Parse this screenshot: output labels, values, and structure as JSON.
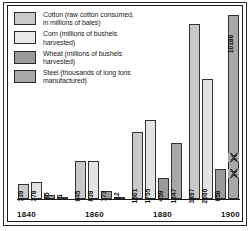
{
  "legend": {
    "items": [
      {
        "name": "cotton",
        "label": "Cotton (raw cotton consumed,\nin millions of bales)",
        "color": "#c9c9c9"
      },
      {
        "name": "corn",
        "label": "Corn (millions of bushels\nharvested)",
        "color": "#e3e3e3"
      },
      {
        "name": "wheat",
        "label": "Wheat (millions of bushels\nharvested)",
        "color": "#9a9a9a"
      },
      {
        "name": "steel",
        "label": "Steel (thousands of long tons\nmanufactured)",
        "color": "#a8a8a8"
      }
    ]
  },
  "chart_data": {
    "type": "bar",
    "title": "",
    "xlabel": "",
    "ylabel": "",
    "categories": [
      "1840",
      "1860",
      "1880",
      "1900"
    ],
    "series": [
      {
        "name": "Cotton (raw cotton consumed, in millions of bales)",
        "color": "#c9c9c9",
        "values": [
          339,
          845,
          1501,
          3897
        ],
        "labels": [
          "339",
          "845",
          "1501",
          "3897"
        ]
      },
      {
        "name": "Corn (millions of bushels harvested)",
        "color": "#e3e3e3",
        "values": [
          378,
          839,
          1755,
          2666
        ],
        "labels": [
          "378",
          "839",
          "1755",
          "2666"
        ]
      },
      {
        "name": "Wheat (millions of bushels harvested)",
        "color": "#9a9a9a",
        "values": [
          85,
          173,
          459,
          658
        ],
        "labels": [
          "85",
          "173",
          "459",
          "658"
        ]
      },
      {
        "name": "Steel (thousands of long tons manufactured)",
        "color": "#a8a8a8",
        "values": [
          1,
          12,
          1247,
          10188
        ],
        "labels": [
          "1",
          "12",
          "1247",
          "10188"
        ]
      }
    ],
    "ylim": [
      0,
      4100
    ],
    "grid": false,
    "legend_position": "top-left"
  }
}
